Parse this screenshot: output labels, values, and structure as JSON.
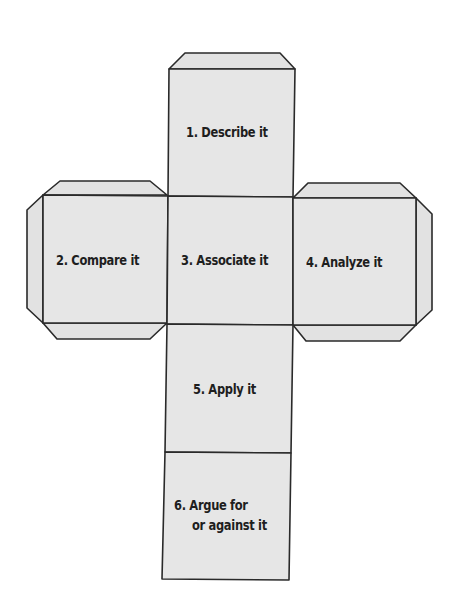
{
  "diagram": {
    "type": "cube-net",
    "colors": {
      "face_fill": "#e6e6e6",
      "stroke": "#2a2a2a",
      "text": "#1e1e1e",
      "background": "#ffffff"
    },
    "faces": [
      {
        "id": 1,
        "label": "1. Describe it"
      },
      {
        "id": 2,
        "label": "2. Compare it"
      },
      {
        "id": 3,
        "label": "3. Associate it"
      },
      {
        "id": 4,
        "label": "4. Analyze it"
      },
      {
        "id": 5,
        "label": "5. Apply it"
      },
      {
        "id": 6,
        "label_line1": "6. Argue for",
        "label_line2": "or against it"
      }
    ]
  }
}
